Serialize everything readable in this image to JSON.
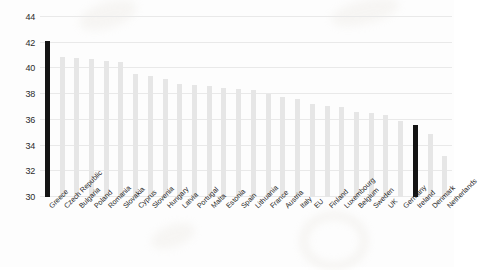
{
  "chart_data": {
    "type": "bar",
    "title": "",
    "subtitle": "",
    "xlabel": "",
    "ylabel": "",
    "ylim": [
      30,
      44
    ],
    "ytick_step": 2,
    "yticks": [
      30,
      32,
      34,
      36,
      38,
      40,
      42,
      44
    ],
    "grid": true,
    "legend": "none",
    "bar_color": "#e6e6e6",
    "highlight_color": "#141414",
    "highlighted_categories": [
      "Greece",
      "Ireland"
    ],
    "categories": [
      "Greece",
      "Czech Republic",
      "Bulgaria",
      "Poland",
      "Romania",
      "Slovakia",
      "Cyprus",
      "Slovenia",
      "Hungary",
      "Latvia",
      "Portugal",
      "Malta",
      "Estonia",
      "Spain",
      "Lithuania",
      "France",
      "Austria",
      "Italy",
      "EU",
      "Finland",
      "Luxembourg",
      "Belgium",
      "Sweden",
      "UK",
      "Germany",
      "Ireland",
      "Denmark",
      "Netherlands"
    ],
    "values": [
      42.1,
      40.9,
      40.8,
      40.7,
      40.6,
      40.5,
      39.6,
      39.4,
      39.2,
      38.8,
      38.7,
      38.6,
      38.5,
      38.4,
      38.3,
      38.0,
      37.8,
      37.6,
      37.2,
      37.1,
      37.0,
      36.6,
      36.5,
      36.4,
      35.9,
      35.6,
      34.9,
      33.2
    ]
  }
}
